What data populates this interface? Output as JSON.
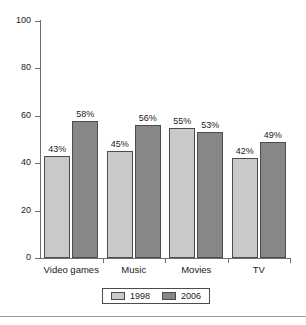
{
  "chart_data": {
    "type": "bar",
    "title": "",
    "subtitle": "",
    "xlabel": "",
    "ylabel": "",
    "categories": [
      "Video games",
      "Music",
      "Movies",
      "TV"
    ],
    "series": [
      {
        "name": "1998",
        "color": "#c9c9c9",
        "values": [
          43,
          45,
          55,
          42
        ],
        "data_labels": [
          "43%",
          "45%",
          "55%",
          "42%"
        ]
      },
      {
        "name": "2006",
        "color": "#878787",
        "values": [
          58,
          56,
          53,
          49
        ],
        "data_labels": [
          "58%",
          "56%",
          "53%",
          "49%"
        ]
      }
    ],
    "ylim": [
      0,
      100
    ],
    "yticks": [
      0,
      20,
      40,
      60,
      80,
      100
    ],
    "ytick_labels": [
      "0",
      "20",
      "40",
      "60",
      "80",
      "100"
    ],
    "grid": false,
    "legend_position": "bottom",
    "legend_entries": [
      "1998",
      "2006"
    ]
  },
  "axis": {
    "ticks": [
      {
        "label": "100",
        "value": 100
      },
      {
        "label": "80",
        "value": 80
      },
      {
        "label": "60",
        "value": 60
      },
      {
        "label": "40",
        "value": 40
      },
      {
        "label": "20",
        "value": 20
      },
      {
        "label": "0",
        "value": 0
      }
    ]
  },
  "groups": [
    {
      "category": "Video games",
      "bars": [
        {
          "series": "1998",
          "value": 43,
          "label": "43%"
        },
        {
          "series": "2006",
          "value": 58,
          "label": "58%"
        }
      ]
    },
    {
      "category": "Music",
      "bars": [
        {
          "series": "1998",
          "value": 45,
          "label": "45%"
        },
        {
          "series": "2006",
          "value": 56,
          "label": "56%"
        }
      ]
    },
    {
      "category": "Movies",
      "bars": [
        {
          "series": "1998",
          "value": 55,
          "label": "55%"
        },
        {
          "series": "2006",
          "value": 53,
          "label": "53%"
        }
      ]
    },
    {
      "category": "TV",
      "bars": [
        {
          "series": "1998",
          "value": 42,
          "label": "42%"
        },
        {
          "series": "2006",
          "value": 49,
          "label": "49%"
        }
      ]
    }
  ],
  "legend": {
    "items": [
      {
        "label": "1998",
        "color": "#c9c9c9"
      },
      {
        "label": "2006",
        "color": "#878787"
      }
    ]
  }
}
